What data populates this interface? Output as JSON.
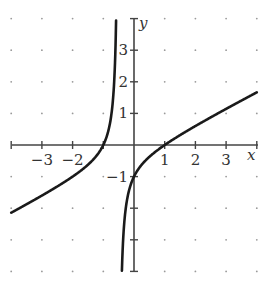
{
  "chart_data": {
    "type": "line",
    "title": "",
    "xlabel": "x",
    "ylabel": "y",
    "xlim": [
      -4,
      4
    ],
    "ylim": [
      -4,
      4
    ],
    "grid": "dots",
    "x_tick_labels": [
      "-3",
      "-2",
      "1",
      "2",
      "3"
    ],
    "y_tick_labels": [
      "3",
      "2",
      "1",
      "-1"
    ],
    "vertical_asymptote": -0.5,
    "function_guess": "f(x) = (x^2 - 1) / (2x + 1)",
    "series": [
      {
        "name": "f(x)",
        "branch": "left",
        "x": [
          -4,
          -3,
          -2,
          -1.5,
          -1,
          -0.8,
          -0.7,
          -0.6,
          -0.55,
          -0.52
        ],
        "y": [
          -2.14,
          -1.6,
          -1.0,
          -0.63,
          0.0,
          0.6,
          1.28,
          3.2,
          6.95,
          17.3
        ]
      },
      {
        "name": "f(x)",
        "branch": "right",
        "x": [
          -0.44,
          -0.4,
          -0.3,
          -0.2,
          0,
          0.5,
          1,
          2,
          3,
          4
        ],
        "y": [
          -7.0,
          -4.2,
          -2.28,
          -1.6,
          -1.0,
          -0.38,
          0.0,
          0.6,
          1.14,
          1.67
        ]
      }
    ]
  },
  "axes": {
    "x_label": "x",
    "y_label": "y",
    "x_ticks": [
      {
        "value": -3,
        "label": "−3"
      },
      {
        "value": -2,
        "label": "−2"
      },
      {
        "value": 1,
        "label": "1"
      },
      {
        "value": 2,
        "label": "2"
      },
      {
        "value": 3,
        "label": "3"
      }
    ],
    "y_ticks": [
      {
        "value": 3,
        "label": "3"
      },
      {
        "value": 2,
        "label": "2"
      },
      {
        "value": 1,
        "label": "1"
      },
      {
        "value": -1,
        "label": "−1"
      }
    ]
  },
  "colors": {
    "curve": "#1a1a1a",
    "axis": "#444444",
    "dots": "#9a9a9a",
    "text": "#333333"
  }
}
